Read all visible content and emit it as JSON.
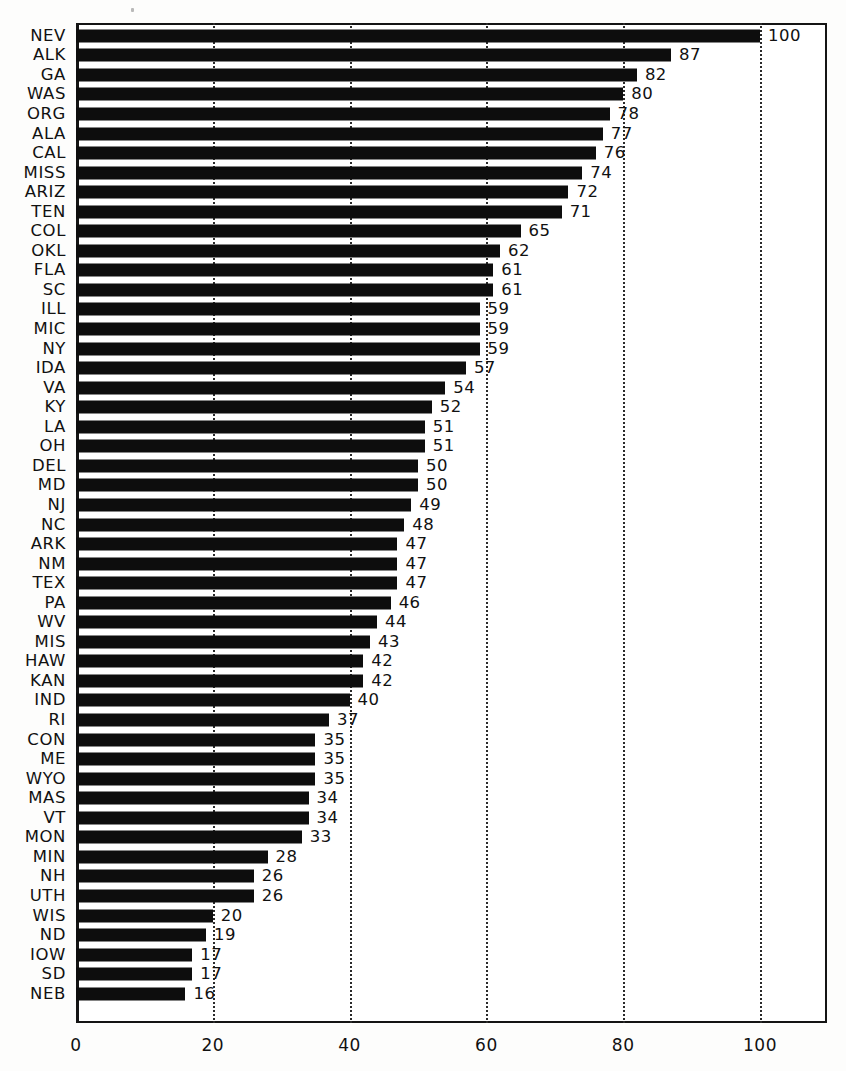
{
  "chart_data": {
    "type": "bar",
    "orientation": "horizontal",
    "title": "",
    "subtitle": "",
    "xlabel": "",
    "ylabel": "",
    "xlim": [
      0,
      110
    ],
    "grid": true,
    "gridlines_at": [
      20,
      40,
      60,
      80,
      100
    ],
    "legend": null,
    "xticks": [
      "0",
      "20",
      "40",
      "60",
      "80",
      "100"
    ],
    "xtick_values": [
      0,
      20,
      40,
      60,
      80,
      100
    ],
    "bar_color": "#0d0d0d",
    "categories": [
      "NEV",
      "ALK",
      "GA",
      "WAS",
      "ORG",
      "ALA",
      "CAL",
      "MISS",
      "ARIZ",
      "TEN",
      "COL",
      "OKL",
      "FLA",
      "SC",
      "ILL",
      "MIC",
      "NY",
      "IDA",
      "VA",
      "KY",
      "LA",
      "OH",
      "DEL",
      "MD",
      "NJ",
      "NC",
      "ARK",
      "NM",
      "TEX",
      "PA",
      "WV",
      "MIS",
      "HAW",
      "KAN",
      "IND",
      "RI",
      "CON",
      "ME",
      "WYO",
      "MAS",
      "VT",
      "MON",
      "MIN",
      "NH",
      "UTH",
      "WIS",
      "ND",
      "IOW",
      "SD",
      "NEB"
    ],
    "values": [
      100,
      87,
      82,
      80,
      78,
      77,
      76,
      74,
      72,
      71,
      65,
      62,
      61,
      61,
      59,
      59,
      59,
      57,
      54,
      52,
      51,
      51,
      50,
      50,
      49,
      48,
      47,
      47,
      47,
      46,
      44,
      43,
      42,
      42,
      40,
      37,
      35,
      35,
      35,
      34,
      34,
      33,
      28,
      26,
      26,
      20,
      19,
      17,
      17,
      16
    ],
    "value_labels": [
      "100",
      "87",
      "82",
      "80",
      "78",
      "77",
      "76",
      "74",
      "72",
      "71",
      "65",
      "62",
      "61",
      "61",
      "59",
      "59",
      "59",
      "57",
      "54",
      "52",
      "51",
      "51",
      "50",
      "50",
      "49",
      "48",
      "47",
      "47",
      "47",
      "46",
      "44",
      "43",
      "42",
      "42",
      "40",
      "37",
      "35",
      "35",
      "35",
      "34",
      "34",
      "33",
      "28",
      "26",
      "26",
      "20",
      "19",
      "17",
      "17",
      "16"
    ]
  }
}
